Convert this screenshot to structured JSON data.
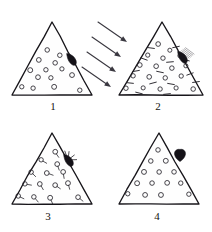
{
  "figure": {
    "background_color": "#ffffff",
    "ink_color": "#17151a",
    "width": 212,
    "height": 232
  },
  "panels": [
    {
      "id": "panel-1",
      "label": "1",
      "label_x": 53,
      "label_y": 110,
      "triangle": {
        "apex_x": 52,
        "apex_y": 22,
        "left_x": 12,
        "left_y": 95,
        "right_x": 92,
        "right_y": 95
      },
      "particle_style": "open-circle",
      "particle_radius": 2.3,
      "particles": [
        {
          "x": 47,
          "y": 50
        },
        {
          "x": 60,
          "y": 55
        },
        {
          "x": 39,
          "y": 60
        },
        {
          "x": 55,
          "y": 63
        },
        {
          "x": 30,
          "y": 70
        },
        {
          "x": 46,
          "y": 70
        },
        {
          "x": 62,
          "y": 69
        },
        {
          "x": 38,
          "y": 77
        },
        {
          "x": 51,
          "y": 78
        },
        {
          "x": 72,
          "y": 75
        },
        {
          "x": 22,
          "y": 87
        },
        {
          "x": 33,
          "y": 88
        },
        {
          "x": 54,
          "y": 87
        },
        {
          "x": 80,
          "y": 90
        }
      ],
      "marker": {
        "type": "leaf-blob",
        "x": 71,
        "y": 59,
        "rotation": -38,
        "has_burst": false,
        "has_shading": false
      },
      "arrows": []
    },
    {
      "id": "panel-2",
      "label": "2",
      "label_x": 158,
      "label_y": 110,
      "triangle": {
        "apex_x": 162,
        "apex_y": 22,
        "left_x": 119,
        "left_y": 95,
        "right_x": 203,
        "right_y": 95
      },
      "particle_style": "circle-and-dash",
      "particle_radius": 2.2,
      "particles": [
        {
          "x": 158,
          "y": 44
        },
        {
          "x": 170,
          "y": 50
        },
        {
          "x": 148,
          "y": 55
        },
        {
          "x": 163,
          "y": 58
        },
        {
          "x": 180,
          "y": 56
        },
        {
          "x": 140,
          "y": 65
        },
        {
          "x": 156,
          "y": 66
        },
        {
          "x": 172,
          "y": 68
        },
        {
          "x": 186,
          "y": 66
        },
        {
          "x": 133,
          "y": 76
        },
        {
          "x": 149,
          "y": 77
        },
        {
          "x": 165,
          "y": 78
        },
        {
          "x": 181,
          "y": 76
        },
        {
          "x": 126,
          "y": 88
        },
        {
          "x": 143,
          "y": 88
        },
        {
          "x": 160,
          "y": 89
        },
        {
          "x": 176,
          "y": 88
        },
        {
          "x": 193,
          "y": 89
        }
      ],
      "dashes": [
        {
          "x": 151,
          "y": 48,
          "angle": 8
        },
        {
          "x": 176,
          "y": 47,
          "angle": -12
        },
        {
          "x": 144,
          "y": 59,
          "angle": 20
        },
        {
          "x": 170,
          "y": 62,
          "angle": -5
        },
        {
          "x": 186,
          "y": 60,
          "angle": 15
        },
        {
          "x": 136,
          "y": 71,
          "angle": -10
        },
        {
          "x": 160,
          "y": 72,
          "angle": 12
        },
        {
          "x": 190,
          "y": 74,
          "angle": -20
        },
        {
          "x": 130,
          "y": 83,
          "angle": 6
        },
        {
          "x": 153,
          "y": 83,
          "angle": -15
        },
        {
          "x": 171,
          "y": 84,
          "angle": 10
        },
        {
          "x": 196,
          "y": 82,
          "angle": -8
        },
        {
          "x": 139,
          "y": 93,
          "angle": 14
        },
        {
          "x": 167,
          "y": 94,
          "angle": -6
        }
      ],
      "marker": {
        "type": "leaf-blob",
        "x": 182,
        "y": 57,
        "rotation": -38,
        "has_burst": false,
        "has_shading": true
      },
      "arrows": [
        {
          "x1": 98,
          "y1": 22,
          "x2": 127,
          "y2": 42
        },
        {
          "x1": 92,
          "y1": 37,
          "x2": 121,
          "y2": 57
        },
        {
          "x1": 87,
          "y1": 52,
          "x2": 116,
          "y2": 72
        },
        {
          "x1": 82,
          "y1": 67,
          "x2": 111,
          "y2": 87
        }
      ],
      "arrow_legend": "incident beam"
    },
    {
      "id": "panel-3",
      "label": "3",
      "label_x": 48,
      "label_y": 220,
      "triangle": {
        "apex_x": 52,
        "apex_y": 133,
        "left_x": 12,
        "left_y": 204,
        "right_x": 92,
        "right_y": 204
      },
      "particle_style": "circle-with-tail",
      "particle_radius": 2.3,
      "particles": [
        {
          "x": 55,
          "y": 152,
          "tail": 55
        },
        {
          "x": 41,
          "y": 160,
          "tail": 30
        },
        {
          "x": 57,
          "y": 164,
          "tail": 70
        },
        {
          "x": 31,
          "y": 172,
          "tail": 45
        },
        {
          "x": 47,
          "y": 173,
          "tail": 20
        },
        {
          "x": 63,
          "y": 172,
          "tail": 80
        },
        {
          "x": 25,
          "y": 184,
          "tail": 10
        },
        {
          "x": 40,
          "y": 184,
          "tail": 60
        },
        {
          "x": 55,
          "y": 185,
          "tail": 35
        },
        {
          "x": 68,
          "y": 183,
          "tail": 75
        },
        {
          "x": 18,
          "y": 196,
          "tail": 25
        },
        {
          "x": 34,
          "y": 197,
          "tail": 50
        },
        {
          "x": 50,
          "y": 198,
          "tail": 65
        },
        {
          "x": 78,
          "y": 197,
          "tail": 40
        }
      ],
      "marker": {
        "type": "leaf-blob",
        "x": 68,
        "y": 160,
        "rotation": -38,
        "has_burst": true,
        "has_shading": false
      },
      "arrows": []
    },
    {
      "id": "panel-4",
      "label": "4",
      "label_x": 157,
      "label_y": 220,
      "triangle": {
        "apex_x": 159,
        "apex_y": 133,
        "left_x": 119,
        "left_y": 204,
        "right_x": 199,
        "right_y": 204
      },
      "particle_style": "open-circle",
      "particle_radius": 2.3,
      "particles": [
        {
          "x": 158,
          "y": 150
        },
        {
          "x": 151,
          "y": 161
        },
        {
          "x": 166,
          "y": 161
        },
        {
          "x": 144,
          "y": 172
        },
        {
          "x": 159,
          "y": 172
        },
        {
          "x": 174,
          "y": 172
        },
        {
          "x": 137,
          "y": 183
        },
        {
          "x": 152,
          "y": 183
        },
        {
          "x": 167,
          "y": 183
        },
        {
          "x": 181,
          "y": 183
        },
        {
          "x": 128,
          "y": 194
        },
        {
          "x": 145,
          "y": 195
        },
        {
          "x": 161,
          "y": 195
        },
        {
          "x": 189,
          "y": 194
        }
      ],
      "marker": {
        "type": "heart-blob",
        "x": 180,
        "y": 155,
        "rotation": 0,
        "has_burst": false,
        "has_shading": false
      },
      "arrows": []
    }
  ]
}
